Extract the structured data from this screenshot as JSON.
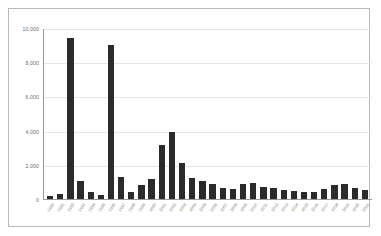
{
  "chart_data": {
    "type": "bar",
    "title": "",
    "xlabel": "",
    "ylabel": "",
    "ylim": [
      0,
      10000
    ],
    "grid": true,
    "legend": null,
    "bar_color": "#2b2b2b",
    "ytick_labels": [
      "10,000",
      "8,000",
      "6,000",
      "4,000",
      "2,000",
      "0"
    ],
    "ytick_values": [
      10000,
      8000,
      6000,
      4000,
      2000,
      0
    ],
    "categories": [
      "1990",
      "1991",
      "1992",
      "1993",
      "1994",
      "1995",
      "1996",
      "1997",
      "1998",
      "1999",
      "2000",
      "2001",
      "2002",
      "2003",
      "2004",
      "2005",
      "2006",
      "2007",
      "2008",
      "2009",
      "2010",
      "2011",
      "2012",
      "2013",
      "2014",
      "2015",
      "2016",
      "2017",
      "2018",
      "2019",
      "2020",
      "2021"
    ],
    "values": [
      180,
      300,
      9500,
      1050,
      430,
      250,
      9050,
      1300,
      400,
      800,
      1150,
      3150,
      3950,
      2100,
      1250,
      1050,
      900,
      620,
      560,
      900,
      940,
      700,
      620,
      520,
      470,
      430,
      400,
      560,
      800,
      900,
      620,
      520
    ]
  }
}
